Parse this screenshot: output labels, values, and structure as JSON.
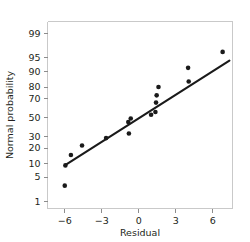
{
  "chart_data": {
    "type": "scatter",
    "title": "",
    "xlabel": "Residual",
    "ylabel": "Normal probability",
    "grid": false,
    "legend": false,
    "yscale": "normal-probability",
    "xlim": [
      -7.4,
      7.6
    ],
    "ylim": [
      0.6,
      99.6
    ],
    "xticks": [
      -6,
      -3,
      0,
      3,
      6
    ],
    "xticklabels": [
      "−6",
      "−3",
      "0",
      "3",
      "6"
    ],
    "yticks": [
      1,
      5,
      10,
      20,
      30,
      50,
      70,
      80,
      90,
      95,
      99
    ],
    "yticklabels": [
      "1",
      "5",
      "10",
      "20",
      "30",
      "50",
      "70",
      "80",
      "90",
      "95",
      "99"
    ],
    "points": [
      {
        "x": -6.0,
        "y": 3.0
      },
      {
        "x": -5.5,
        "y": 15.0
      },
      {
        "x": -5.95,
        "y": 9.3
      },
      {
        "x": -4.6,
        "y": 22.0
      },
      {
        "x": -2.65,
        "y": 28.5
      },
      {
        "x": -0.85,
        "y": 45.0
      },
      {
        "x": -0.65,
        "y": 49.0
      },
      {
        "x": -0.8,
        "y": 33.0
      },
      {
        "x": 1.0,
        "y": 53.0
      },
      {
        "x": 1.35,
        "y": 56.0
      },
      {
        "x": 1.4,
        "y": 66.0
      },
      {
        "x": 1.45,
        "y": 73.0
      },
      {
        "x": 1.6,
        "y": 80.0
      },
      {
        "x": 4.0,
        "y": 91.5
      },
      {
        "x": 4.05,
        "y": 84.0
      },
      {
        "x": 6.8,
        "y": 96.5
      }
    ],
    "fit_line": {
      "x_start": -6.0,
      "y_start": 9.3,
      "x_end": 7.35,
      "y_end": 94.2
    },
    "colors": {
      "point": "#1a1a1a",
      "line": "#1a1a1a",
      "frame": "#c9c9c9",
      "text": "#231f20",
      "background": "#ffffff"
    }
  }
}
